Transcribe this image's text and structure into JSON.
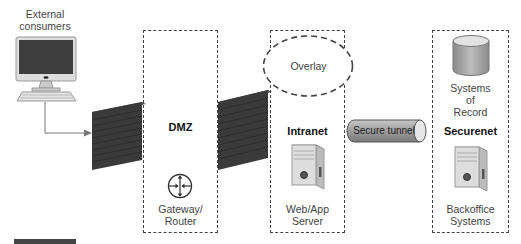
{
  "diagram": {
    "type": "network-zones",
    "external": {
      "label_line1": "External",
      "label_line2": "consumers",
      "icon": "desktop-computer-icon"
    },
    "zones": [
      {
        "id": "dmz",
        "title": "DMZ",
        "component_line1": "Gateway/",
        "component_line2": "Router",
        "icon": "router-icon"
      },
      {
        "id": "intranet",
        "title": "Intranet",
        "component_line1": "Web/App",
        "component_line2": "Server",
        "icon": "server-tower-icon",
        "overlay_label": "Overlay"
      },
      {
        "id": "securenet",
        "title": "Securenet",
        "top_line1": "Systems",
        "top_line2": "of",
        "top_line3": "Record",
        "top_icon": "database-icon",
        "component_line1": "Backoffice",
        "component_line2": "Systems",
        "icon": "server-tower-icon"
      }
    ],
    "firewalls": [
      {
        "icon": "firewall-brick-icon"
      },
      {
        "icon": "firewall-brick-icon"
      }
    ],
    "tunnel": {
      "label": "Secure tunnel",
      "icon": "pipe-tunnel-icon"
    },
    "colors": {
      "border": "#444444",
      "firewall": "#3a3a3a",
      "tunnel": "#9a9a9a",
      "background": "#ffffff"
    }
  }
}
